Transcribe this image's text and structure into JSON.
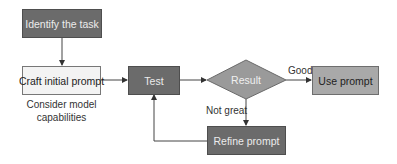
{
  "nodes": {
    "identify": {
      "label": "Identify the task",
      "shape": "rectangle",
      "fill": "#6b6b6b"
    },
    "craft": {
      "label": "Craft initial prompt",
      "shape": "rectangle",
      "fill": "#f3f3f3"
    },
    "test": {
      "label": "Test",
      "shape": "rectangle",
      "fill": "#6b6b6b"
    },
    "result": {
      "label": "Result",
      "shape": "diamond",
      "fill": "#9a9a9a"
    },
    "use": {
      "label": "Use prompt",
      "shape": "rectangle",
      "fill": "#a9a9a9"
    },
    "refine": {
      "label": "Refine prompt",
      "shape": "rectangle",
      "fill": "#6b6b6b"
    }
  },
  "annotations": {
    "craft_note_line1": "Consider model",
    "craft_note_line2": "capabilities"
  },
  "edges": {
    "good_label": "Good",
    "not_great_label": "Not great"
  },
  "connections": [
    {
      "from": "identify",
      "to": "craft"
    },
    {
      "from": "craft",
      "to": "test"
    },
    {
      "from": "test",
      "to": "result"
    },
    {
      "from": "result",
      "to": "use",
      "label": "Good"
    },
    {
      "from": "result",
      "to": "refine",
      "label": "Not great"
    },
    {
      "from": "refine",
      "to": "test"
    }
  ]
}
